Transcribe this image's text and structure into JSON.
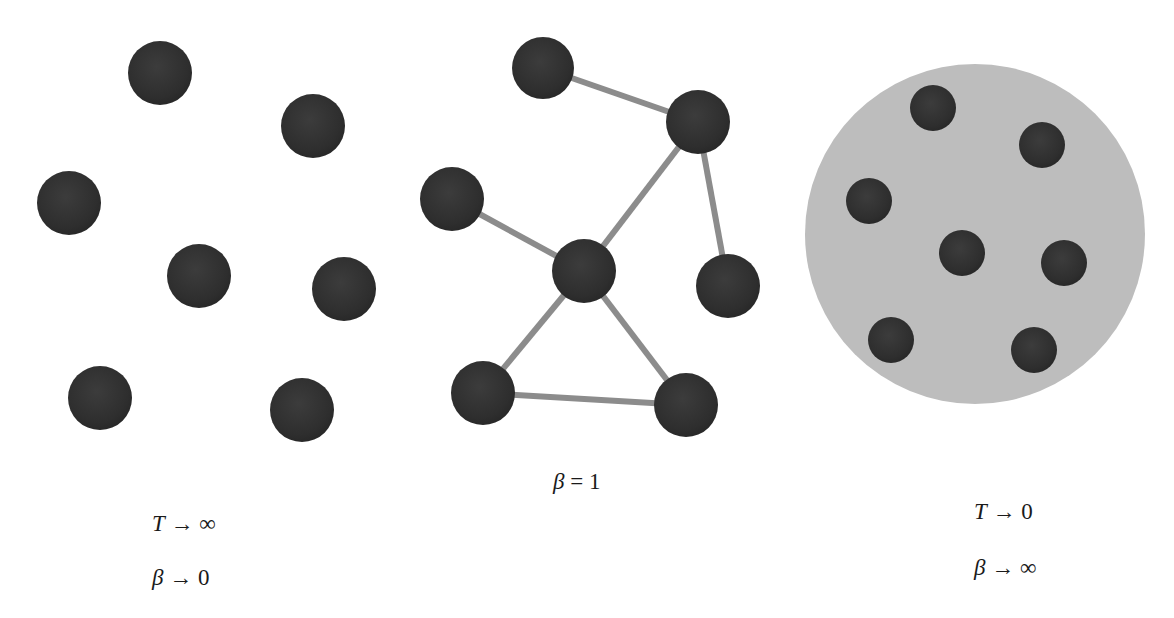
{
  "colors": {
    "node": "#2f2f2f",
    "node_highlight": "#4a4a4a",
    "edge": "#8c8c8c",
    "cluster_fill": "#bdbdbd",
    "background": "#ffffff"
  },
  "panels": [
    {
      "id": "disordered",
      "description": "Free nodes, no connections (high temperature)",
      "nodes": [
        {
          "x": 160,
          "y": 73,
          "r": 32
        },
        {
          "x": 313,
          "y": 126,
          "r": 32
        },
        {
          "x": 69,
          "y": 203,
          "r": 32
        },
        {
          "x": 199,
          "y": 276,
          "r": 32
        },
        {
          "x": 344,
          "y": 289,
          "r": 32
        },
        {
          "x": 100,
          "y": 398,
          "r": 32
        },
        {
          "x": 302,
          "y": 410,
          "r": 32
        }
      ],
      "edges": [],
      "labels": [
        {
          "var": "T",
          "op": "→",
          "val": "∞",
          "x": 152,
          "y": 512
        },
        {
          "var": "β",
          "op": "→",
          "val": "0",
          "x": 152,
          "y": 566
        }
      ]
    },
    {
      "id": "network",
      "description": "Connected graph (intermediate)",
      "nodes": [
        {
          "x": 543,
          "y": 68,
          "r": 31
        },
        {
          "x": 698,
          "y": 122,
          "r": 32
        },
        {
          "x": 452,
          "y": 199,
          "r": 32
        },
        {
          "x": 584,
          "y": 271,
          "r": 32
        },
        {
          "x": 728,
          "y": 286,
          "r": 32
        },
        {
          "x": 483,
          "y": 393,
          "r": 32
        },
        {
          "x": 686,
          "y": 405,
          "r": 32
        }
      ],
      "edges": [
        [
          0,
          1
        ],
        [
          1,
          3
        ],
        [
          1,
          4
        ],
        [
          2,
          3
        ],
        [
          3,
          5
        ],
        [
          3,
          6
        ],
        [
          5,
          6
        ]
      ],
      "labels": [
        {
          "var": "β",
          "op": "=",
          "val": "1",
          "x": 553,
          "y": 470
        }
      ]
    },
    {
      "id": "condensed",
      "description": "Nodes condensed inside a single cluster (low temperature)",
      "cluster": {
        "x": 975,
        "y": 234,
        "r": 170
      },
      "nodes": [
        {
          "x": 933,
          "y": 108,
          "r": 23
        },
        {
          "x": 1042,
          "y": 145,
          "r": 23
        },
        {
          "x": 869,
          "y": 201,
          "r": 23
        },
        {
          "x": 962,
          "y": 253,
          "r": 23
        },
        {
          "x": 1064,
          "y": 263,
          "r": 23
        },
        {
          "x": 891,
          "y": 340,
          "r": 23
        },
        {
          "x": 1034,
          "y": 350,
          "r": 23
        }
      ],
      "edges": [],
      "labels": [
        {
          "var": "T",
          "op": "→",
          "val": "0",
          "x": 974,
          "y": 500
        },
        {
          "var": "β",
          "op": "→",
          "val": "∞",
          "x": 974,
          "y": 556
        }
      ]
    }
  ]
}
